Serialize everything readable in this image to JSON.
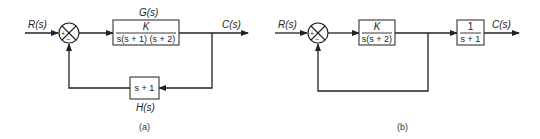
{
  "diagram_a": {
    "caption": "(a)",
    "input_label": "R(s)",
    "output_label": "C(s)",
    "summing_junction": {
      "plus_sign": "+",
      "minus_sign": "−"
    },
    "forward_block": {
      "name_label": "G(s)",
      "numerator": "K",
      "denominator": "s(s + 1) (s + 2)"
    },
    "feedback_block": {
      "name_label": "H(s)",
      "expression": "s + 1"
    }
  },
  "diagram_b": {
    "caption": "(b)",
    "input_label": "R(s)",
    "output_label": "C(s)",
    "summing_junction": {
      "plus_sign": "+",
      "minus_sign": "−"
    },
    "forward_block": {
      "numerator": "K",
      "denominator": "s(s + 2)"
    },
    "output_block": {
      "numerator": "1",
      "denominator": "s + 1"
    },
    "feedback": "unity"
  }
}
